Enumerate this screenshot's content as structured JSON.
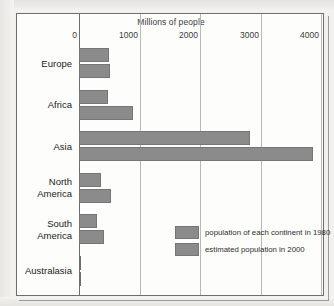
{
  "chart_data": {
    "type": "bar",
    "title": "Millions of people",
    "xlabel": "Millions of people",
    "ylabel": "",
    "orientation": "horizontal",
    "grid": true,
    "xlim": [
      0,
      4000
    ],
    "xticks": [
      0,
      1000,
      2000,
      3000,
      4000
    ],
    "xtick_labels": [
      "0",
      "1000",
      "2000",
      "3000",
      "4000"
    ],
    "categories": [
      "Europe",
      "Africa",
      "Asia",
      "North America",
      "South America",
      "Australasia"
    ],
    "category_lines": [
      [
        "Europe"
      ],
      [
        "Africa"
      ],
      [
        "Asia"
      ],
      [
        "North",
        "America"
      ],
      [
        "South",
        "America"
      ],
      [
        "Australasia"
      ]
    ],
    "legend_position": "inside-lower-right",
    "series": [
      {
        "name": "population of each continent in 1980",
        "values": [
          490,
          480,
          2820,
          370,
          300,
          20
        ]
      },
      {
        "name": "estimated population in 2000",
        "values": [
          510,
          890,
          3870,
          530,
          420,
          25
        ]
      }
    ],
    "bar_color": "#8b8b8b",
    "bar_border_color": "#757575",
    "gridline_color": "#b8b8b6",
    "axis_color": "#6e6e6c"
  },
  "legend": {
    "entries": [
      {
        "label": "population of each continent in 1980",
        "swatch": "#8b8b8b"
      },
      {
        "label": "estimated population in 2000",
        "swatch": "#8b8b8b"
      }
    ]
  }
}
